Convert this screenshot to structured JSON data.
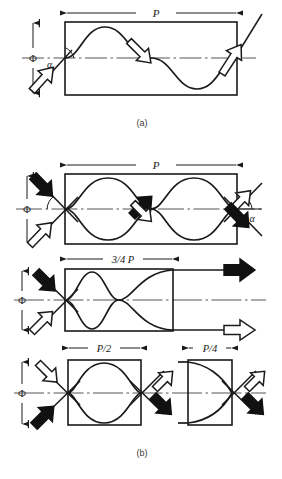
{
  "figure": {
    "title": "",
    "captions": [
      {
        "id": "a",
        "label": "(a)"
      },
      {
        "id": "b",
        "label": "(b)"
      }
    ],
    "symbols": {
      "phi": "Φ",
      "alpha": "α",
      "pitch": "P"
    }
  },
  "panels": [
    {
      "id": "a",
      "caption": "(a)",
      "dimensions": [
        {
          "name": "pitch-top",
          "label": "P",
          "position": "top"
        }
      ],
      "vertical_dimension": {
        "label": "Φ"
      },
      "angles": [
        {
          "label": "α",
          "position": "left-inlet"
        }
      ],
      "arrows": [
        {
          "name": "inlet-arrow",
          "style": "hollow",
          "direction": "up-right",
          "position": "bottom-left"
        },
        {
          "name": "outlet-arrow",
          "style": "hollow",
          "direction": "up-right",
          "position": "top-right"
        },
        {
          "name": "interior-arrow",
          "style": "hollow",
          "direction": "down-right",
          "position": "center"
        }
      ],
      "curves": 1
    },
    {
      "id": "b-top",
      "caption": "",
      "dimensions": [
        {
          "name": "pitch-top",
          "label": "P",
          "position": "top"
        },
        {
          "name": "pitch-bottom",
          "label": "3/4 P",
          "position": "bottom"
        }
      ],
      "vertical_dimension": {
        "label": "Φ"
      },
      "angles": [
        {
          "label": "α",
          "position": "left-inlet"
        },
        {
          "label": "α",
          "position": "right-outlet"
        }
      ],
      "arrows": [
        {
          "name": "inlet-arrow-solid",
          "style": "solid",
          "direction": "down-right",
          "position": "top-left"
        },
        {
          "name": "inlet-arrow-hollow",
          "style": "hollow",
          "direction": "up-right",
          "position": "bottom-left"
        },
        {
          "name": "outlet-arrow-hollow",
          "style": "hollow",
          "direction": "up-right",
          "position": "top-right"
        },
        {
          "name": "outlet-arrow-solid",
          "style": "solid",
          "direction": "down-right",
          "position": "bottom-right"
        },
        {
          "name": "interior-arrow-solid",
          "style": "solid",
          "direction": "up-right",
          "position": "center"
        },
        {
          "name": "interior-arrow-hollow",
          "style": "hollow",
          "direction": "down-right",
          "position": "center"
        }
      ],
      "curves": 2
    },
    {
      "id": "b-middle",
      "caption": "",
      "dimensions": [
        {
          "name": "pitch-top",
          "label": "3/4 P",
          "position": "top"
        },
        {
          "name": "pitch-bottom-left",
          "label": "P/2",
          "position": "bottom"
        },
        {
          "name": "pitch-bottom-right",
          "label": "P/4",
          "position": "bottom"
        }
      ],
      "vertical_dimension": {
        "label": "Φ"
      },
      "angles": [],
      "arrows": [
        {
          "name": "inlet-arrow-solid",
          "style": "solid",
          "direction": "down-right",
          "position": "top-left"
        },
        {
          "name": "inlet-arrow-hollow",
          "style": "hollow",
          "direction": "up-right",
          "position": "bottom-left"
        },
        {
          "name": "outlet-arrow-solid",
          "style": "solid",
          "direction": "right",
          "position": "top-right"
        },
        {
          "name": "outlet-arrow-hollow",
          "style": "hollow",
          "direction": "right",
          "position": "bottom-right"
        }
      ],
      "curves": 1
    },
    {
      "id": "b-bottom",
      "caption": "(b)",
      "dimensions": [
        {
          "name": "pitch-left",
          "label": "P/2",
          "position": "top"
        },
        {
          "name": "pitch-right",
          "label": "P/4",
          "position": "top"
        }
      ],
      "vertical_dimension": {
        "label": "Φ"
      },
      "angles": [],
      "arrows": [
        {
          "name": "inlet-arrow-hollow",
          "style": "hollow",
          "direction": "down-right",
          "position": "top-left"
        },
        {
          "name": "inlet-arrow-solid",
          "style": "solid",
          "direction": "up-right",
          "position": "bottom-left"
        },
        {
          "name": "outlet-arrow-hollow-left",
          "style": "hollow",
          "direction": "up-right",
          "position": "top-center"
        },
        {
          "name": "outlet-arrow-solid-left",
          "style": "solid",
          "direction": "down-right",
          "position": "bottom-center"
        },
        {
          "name": "outlet-arrow-hollow-right",
          "style": "hollow",
          "direction": "up-right",
          "position": "top-right"
        },
        {
          "name": "outlet-arrow-solid-right",
          "style": "solid",
          "direction": "down-right",
          "position": "bottom-right"
        }
      ],
      "curves": 2
    }
  ],
  "labels": {
    "P": "P",
    "three_quarter_P": "3/4 P",
    "half_P": "P/2",
    "quarter_P": "P/4",
    "phi": "Φ",
    "alpha": "α",
    "cap_a": "(a)",
    "cap_b": "(b)"
  },
  "colors": {
    "line": "#1a1a1a",
    "fill_solid": "#111111",
    "fill_hollow": "#ffffff",
    "centerline": "#555555",
    "background": "#ffffff"
  }
}
